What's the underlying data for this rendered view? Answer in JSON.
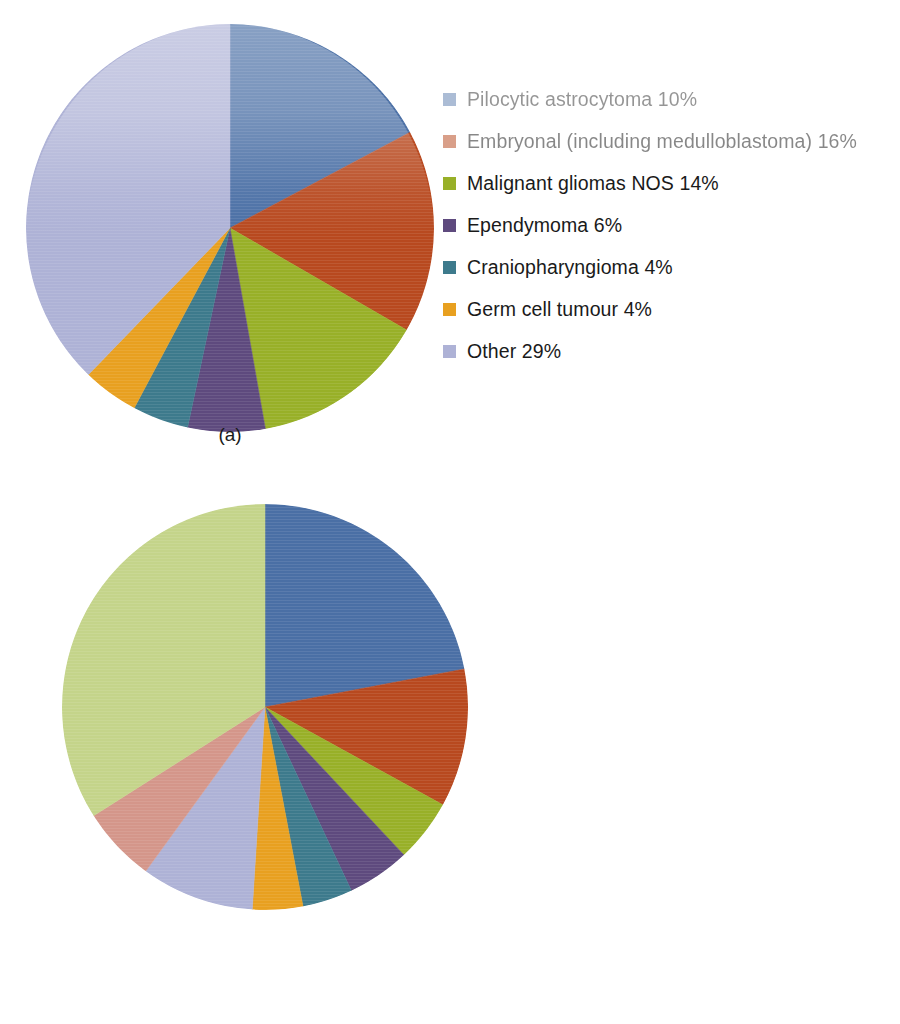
{
  "figure": {
    "panels": [
      {
        "id": "a",
        "caption": "(a)",
        "chart_data": {
          "type": "pie",
          "title": "",
          "legend_position": "right",
          "start_angle_deg": 0,
          "direction": "clockwise",
          "categories": [
            "Pilocytic astrocytoma",
            "Embryonal (including medulloblastoma)",
            "Malignant gliomas NOS",
            "Ependymoma",
            "Craniopharyngioma",
            "Germ cell tumour",
            "Other"
          ],
          "values": [
            10,
            16,
            14,
            6,
            4,
            4,
            29
          ],
          "value_suffix": "%",
          "colors": [
            "#4a6fa5",
            "#b8491f",
            "#98b028",
            "#5e4a7e",
            "#3d7a8c",
            "#e8a020",
            "#aeb2d6"
          ],
          "legend_items": [
            {
              "label": "Pilocytic astrocytoma 10%",
              "color": "#4a6fa5"
            },
            {
              "label": "Embryonal (including medulloblastoma) 16%",
              "color": "#b8491f"
            },
            {
              "label": "Malignant gliomas NOS 14%",
              "color": "#98b028"
            },
            {
              "label": "Ependymoma 6%",
              "color": "#5e4a7e"
            },
            {
              "label": "Craniopharyngioma 4%",
              "color": "#3d7a8c"
            },
            {
              "label": "Germ cell tumour 4%",
              "color": "#e8a020"
            },
            {
              "label": "Other 29%",
              "color": "#aeb2d6"
            }
          ],
          "slice_angles_deg": [
            62,
            58,
            50,
            22,
            16,
            16,
            136
          ]
        }
      },
      {
        "id": "b",
        "caption": "(b)",
        "chart_data": {
          "type": "pie",
          "title": "",
          "legend_position": "right",
          "start_angle_deg": 0,
          "direction": "clockwise",
          "categories": [
            "Pituitary",
            "Pilocytic astrocytoma",
            "Ependymoma",
            "Germ cell tumor",
            "Meningioma",
            "Embryonal tumors",
            "Other  astrocytomas",
            "Nerve sheath",
            "Other"
          ],
          "values": [
            22,
            11,
            5,
            5,
            4,
            4,
            9,
            6,
            34
          ],
          "value_suffix": "%",
          "colors": [
            "#4a6fa5",
            "#b8491f",
            "#98b028",
            "#5e4a7e",
            "#3d7a8c",
            "#e8a020",
            "#aeb2d6",
            "#d4968a",
            "#c4d48a"
          ],
          "legend_items": [
            {
              "label": "Pituitary 22%",
              "color": "#4a6fa5"
            },
            {
              "label": "Pilocytic astrocytoma 11%",
              "color": "#b8491f"
            },
            {
              "label": "Ependymoma 5%",
              "color": "#98b028"
            },
            {
              "label": "Germ cell tumor 5%",
              "color": "#5e4a7e"
            },
            {
              "label": "Meningioma 4%",
              "color": "#3d7a8c"
            },
            {
              "label": "Embryonal tumors 4%",
              "color": "#e8a020"
            },
            {
              "label": "Other  astrocytomas 9%",
              "color": "#aeb2d6"
            },
            {
              "label": "Nerve sheath 6%",
              "color": "#d4968a"
            },
            {
              "label": "Other 34%",
              "color": "#c4d48a"
            }
          ],
          "slice_angles_deg": [
            79.2,
            39.6,
            18,
            18,
            14.4,
            14.4,
            32.4,
            21.6,
            122.4
          ]
        }
      }
    ]
  }
}
